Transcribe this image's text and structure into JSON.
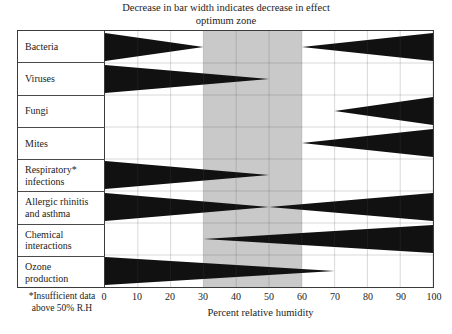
{
  "title": {
    "line1": "Decrease in bar width indicates decrease in effect",
    "line2": "optimum zone"
  },
  "axis": {
    "xlabel": "Percent relative humidity",
    "ticks": [
      "0",
      "10",
      "20",
      "30",
      "40",
      "50",
      "60",
      "70",
      "80",
      "90",
      "100"
    ]
  },
  "footnote": {
    "line1": "*Insufficient data",
    "line2": "above 50% R.H"
  },
  "colors": {
    "bar": "#111111",
    "optimum_zone": "#c9c9c9",
    "grid": "#4a4a4a",
    "frame": "#3a3a3a",
    "background": "#ffffff"
  },
  "rows": [
    {
      "label1": "Bacteria",
      "label2": ""
    },
    {
      "label1": "Viruses",
      "label2": ""
    },
    {
      "label1": "Fungi",
      "label2": ""
    },
    {
      "label1": "Mites",
      "label2": ""
    },
    {
      "label1": "Respiratory*",
      "label2": "infections"
    },
    {
      "label1": "Allergic rhinitis",
      "label2": "and asthma"
    },
    {
      "label1": "Chemical",
      "label2": "interactions"
    },
    {
      "label1": "Ozone",
      "label2": "production"
    }
  ],
  "chart_data": {
    "type": "area",
    "xlabel": "Percent relative humidity",
    "ylabel": "",
    "xlim": [
      0,
      100
    ],
    "xticks": [
      0,
      10,
      20,
      30,
      40,
      50,
      60,
      70,
      80,
      90,
      100
    ],
    "grid": true,
    "legend": "none",
    "optimum_zone": [
      30,
      60
    ],
    "annotations": [
      "optimum zone",
      "*Insufficient data above 50% R.H"
    ],
    "note": "Each row is a horizontal wedge band; width (thickness) encodes magnitude of effect from 0 (no effect) to 1 (maximum effect) across relative humidity.",
    "categories": [
      "Bacteria",
      "Viruses",
      "Fungi",
      "Mites",
      "Respiratory* infections",
      "Allergic rhinitis and asthma",
      "Chemical interactions",
      "Ozone production"
    ],
    "series": [
      {
        "name": "Bacteria",
        "segments": [
          {
            "x": [
              0,
              30
            ],
            "width": [
              1,
              0
            ]
          },
          {
            "x": [
              60,
              100
            ],
            "width": [
              0,
              1
            ]
          }
        ]
      },
      {
        "name": "Viruses",
        "segments": [
          {
            "x": [
              0,
              50
            ],
            "width": [
              1,
              0
            ]
          }
        ]
      },
      {
        "name": "Fungi",
        "segments": [
          {
            "x": [
              70,
              100
            ],
            "width": [
              0,
              1
            ]
          }
        ]
      },
      {
        "name": "Mites",
        "segments": [
          {
            "x": [
              60,
              100
            ],
            "width": [
              0,
              1
            ]
          }
        ]
      },
      {
        "name": "Respiratory* infections",
        "segments": [
          {
            "x": [
              0,
              50
            ],
            "width": [
              1,
              0
            ]
          }
        ]
      },
      {
        "name": "Allergic rhinitis and asthma",
        "segments": [
          {
            "x": [
              0,
              50
            ],
            "width": [
              1,
              0
            ]
          },
          {
            "x": [
              50,
              100
            ],
            "width": [
              0,
              1
            ]
          }
        ]
      },
      {
        "name": "Chemical interactions",
        "segments": [
          {
            "x": [
              30,
              100
            ],
            "width": [
              0,
              1
            ]
          }
        ]
      },
      {
        "name": "Ozone production",
        "segments": [
          {
            "x": [
              0,
              70
            ],
            "width": [
              1,
              0
            ]
          }
        ]
      }
    ]
  }
}
